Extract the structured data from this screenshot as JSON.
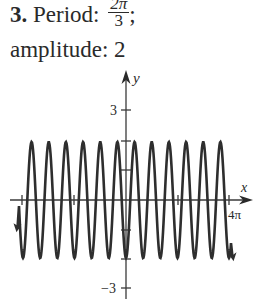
{
  "problem": {
    "number": "3.",
    "period_label": "Period:",
    "period_num": "2π",
    "period_den": "3",
    "period_suffix": ";",
    "amplitude_label": "amplitude: 2"
  },
  "chart_data": {
    "type": "line",
    "title": "",
    "function": "y = -2cos(3x)",
    "period": "2π/3",
    "amplitude": 2,
    "xlabel": "x",
    "ylabel": "y",
    "x_range": [
      -4.6,
      4.6
    ],
    "x_range_unit": "π",
    "ylim": [
      -3,
      3
    ],
    "y_tick_labels": [
      "3",
      "-3"
    ],
    "x_tick_labels": [
      "4π"
    ],
    "x_ticks_pi": [
      -4,
      -2,
      2,
      4
    ],
    "y_ticks": [
      -3,
      -2,
      -1,
      1,
      2,
      3
    ],
    "grid": false,
    "legend": null,
    "peaks_visible": 12
  },
  "axis": {
    "x_label": "x",
    "y_label": "y",
    "y_top_tick": "3",
    "y_bottom_tick": "−3",
    "x_right_tick": "4π"
  },
  "colors": {
    "curve": "#2e2e2e",
    "axis": "#3a3a3a",
    "background": "#ffffff"
  }
}
